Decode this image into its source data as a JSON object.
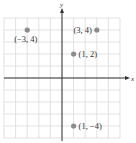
{
  "chart_data": {
    "type": "scatter",
    "title": "",
    "xlabel": "x",
    "ylabel": "y",
    "xlim": [
      -5,
      5
    ],
    "ylim": [
      -5,
      5
    ],
    "grid": true,
    "points": [
      {
        "x": -3,
        "y": 4,
        "label": "(−3, 4)"
      },
      {
        "x": 3,
        "y": 4,
        "label": "(3, 4)"
      },
      {
        "x": 1,
        "y": 2,
        "label": "(1, 2)"
      },
      {
        "x": 1,
        "y": -4,
        "label": "(1, −4)"
      }
    ]
  },
  "colors": {
    "grid": "#d9d9d9",
    "axis": "#333333",
    "point": "#8c8c8c",
    "text": "#333333"
  },
  "axes": {
    "x_label": "x",
    "y_label": "y"
  }
}
